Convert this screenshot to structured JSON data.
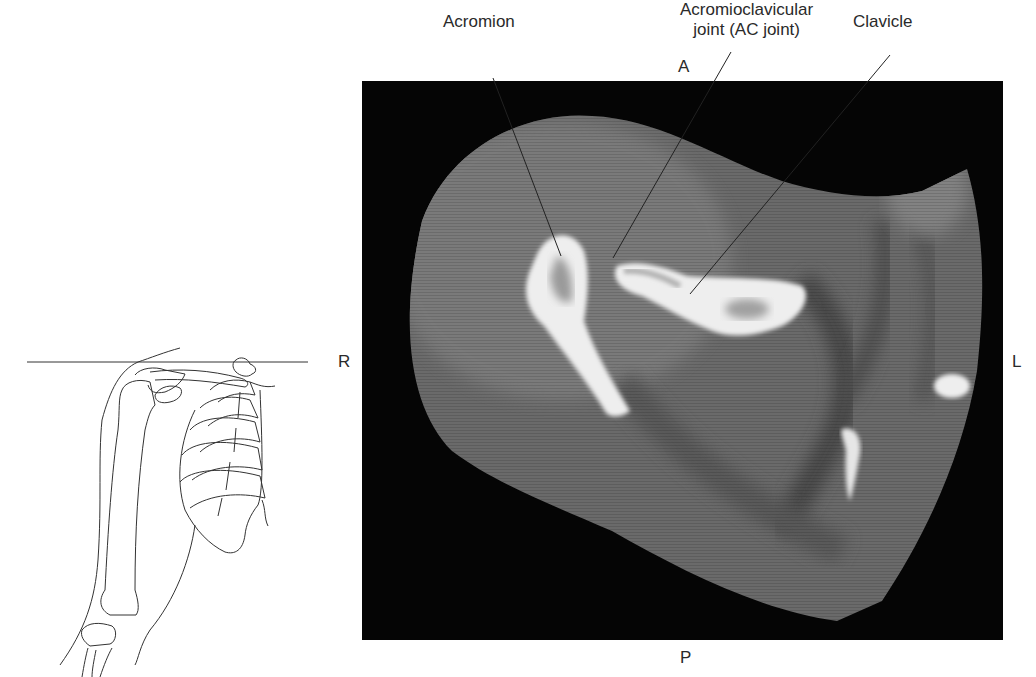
{
  "figure": {
    "type": "axial CT slice of shoulder with reference drawing",
    "labels": {
      "acromion": "Acromion",
      "ac_joint_line1": "Acromioclavicular",
      "ac_joint_line2": "joint (AC joint)",
      "clavicle": "Clavicle"
    },
    "orientation": {
      "anterior": "A",
      "posterior": "P",
      "right": "R",
      "left": "L"
    },
    "colors": {
      "background": "#ffffff",
      "ct_background": "#050505",
      "soft_tissue": "#6e6e6e",
      "bone": "#f2f2f2",
      "line_art": "#333333"
    }
  }
}
